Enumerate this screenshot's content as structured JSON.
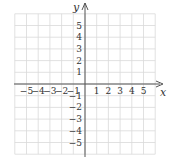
{
  "chart_data": {
    "type": "coordinate-grid",
    "title": "",
    "xlabel": "x",
    "ylabel": "y",
    "xlim": [
      -6,
      6
    ],
    "ylim": [
      -6,
      6
    ],
    "grid": true,
    "x_ticks": [
      -5,
      -4,
      -3,
      -2,
      -1,
      1,
      2,
      3,
      4,
      5
    ],
    "y_ticks": [
      5,
      4,
      3,
      2,
      1,
      -1,
      -2,
      -3,
      -4,
      -5
    ],
    "x_tick_labels": [
      "−5",
      "−4",
      "−3",
      "−2",
      "−1",
      "1",
      "2",
      "3",
      "4",
      "5"
    ],
    "y_tick_labels": [
      "5",
      "4",
      "3",
      "2",
      "1",
      "−1",
      "−2",
      "−3",
      "−4",
      "−5"
    ],
    "points": []
  },
  "axes": {
    "x_label": "x",
    "y_label": "y"
  },
  "colors": {
    "grid": "#d9d9d9",
    "axis": "#555555",
    "text": "#333333"
  }
}
